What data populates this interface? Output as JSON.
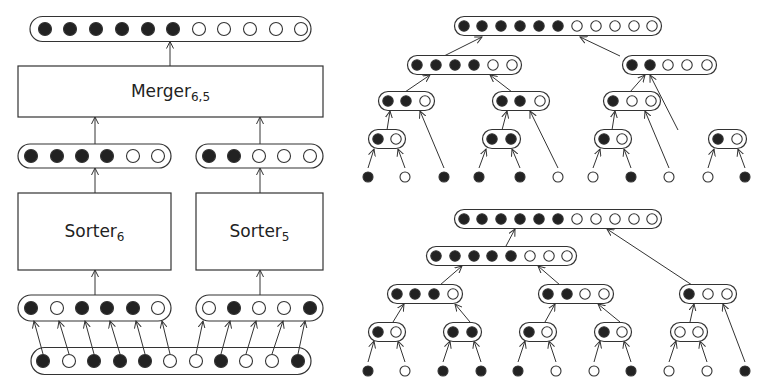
{
  "colors": {
    "stroke": "#333333",
    "filled": "#222222",
    "empty": "#ffffff",
    "background": "#ffffff"
  },
  "left_diagram": {
    "output": {
      "x1": 30,
      "x2": 311,
      "y": 29,
      "h": 25,
      "dots": [
        45,
        70,
        96,
        122,
        148,
        173,
        199,
        224,
        250,
        276,
        301
      ],
      "values": [
        1,
        1,
        1,
        1,
        1,
        1,
        0,
        0,
        0,
        0,
        0
      ]
    },
    "merger": {
      "label": "Merger",
      "subscript": "6,5",
      "x": 18,
      "y": 66,
      "w": 305,
      "h": 51
    },
    "mid_left": {
      "x1": 18,
      "x2": 171,
      "y": 156,
      "h": 24,
      "dots": [
        31,
        57,
        82,
        107,
        133,
        158
      ],
      "values": [
        1,
        1,
        1,
        1,
        0,
        0
      ]
    },
    "mid_right": {
      "x1": 196,
      "x2": 323,
      "y": 156,
      "h": 24,
      "dots": [
        209,
        234,
        259,
        284,
        310
      ],
      "values": [
        1,
        1,
        0,
        0,
        0
      ]
    },
    "sorter_left": {
      "label": "Sorter",
      "subscript": "6",
      "x": 18,
      "y": 193,
      "w": 153,
      "h": 77
    },
    "sorter_right": {
      "label": "Sorter",
      "subscript": "5",
      "x": 196,
      "y": 193,
      "w": 127,
      "h": 77
    },
    "in_left": {
      "x1": 18,
      "x2": 171,
      "y": 308,
      "h": 26,
      "dots": [
        31,
        57,
        82,
        107,
        133,
        158
      ],
      "values": [
        1,
        0,
        1,
        1,
        1,
        0
      ]
    },
    "in_right": {
      "x1": 196,
      "x2": 323,
      "y": 308,
      "h": 26,
      "dots": [
        209,
        234,
        259,
        284,
        310
      ],
      "values": [
        0,
        1,
        0,
        0,
        1
      ]
    },
    "input": {
      "x1": 31,
      "x2": 311,
      "y": 361,
      "h": 27,
      "dots": [
        43,
        69,
        94,
        120,
        145,
        170,
        196,
        221,
        246,
        272,
        298
      ],
      "values": [
        1,
        0,
        1,
        1,
        1,
        0,
        0,
        1,
        0,
        0,
        1
      ]
    },
    "split_arrows": [
      [
        43,
        34
      ],
      [
        69,
        59
      ],
      [
        94,
        85
      ],
      [
        120,
        110
      ],
      [
        145,
        136
      ],
      [
        170,
        162
      ],
      [
        196,
        203
      ],
      [
        221,
        230
      ],
      [
        246,
        256
      ],
      [
        272,
        283
      ],
      [
        298,
        305
      ]
    ]
  },
  "right_top_tree": {
    "nodes": [
      {
        "id": "root",
        "y": 26,
        "dots": [
          464,
          482,
          501,
          520,
          539,
          558,
          577,
          596,
          615,
          634,
          652
        ],
        "values": [
          1,
          1,
          1,
          1,
          1,
          1,
          0,
          0,
          0,
          0,
          0
        ]
      },
      {
        "id": "L",
        "y": 65,
        "dots": [
          417,
          436,
          455,
          474,
          493,
          512
        ],
        "values": [
          1,
          1,
          1,
          1,
          0,
          0
        ]
      },
      {
        "id": "R",
        "y": 65,
        "dots": [
          632,
          650,
          668,
          687,
          707
        ],
        "values": [
          1,
          1,
          0,
          0,
          0
        ]
      },
      {
        "id": "LL",
        "y": 101,
        "dots": [
          388,
          406,
          425
        ],
        "values": [
          1,
          1,
          0
        ]
      },
      {
        "id": "LR",
        "y": 101,
        "dots": [
          502,
          520,
          540
        ],
        "values": [
          1,
          1,
          0
        ]
      },
      {
        "id": "RL",
        "y": 101,
        "dots": [
          613,
          632,
          651
        ],
        "values": [
          1,
          0,
          0
        ]
      },
      {
        "id": "LLa",
        "y": 139,
        "dots": [
          378,
          396
        ],
        "values": [
          1,
          0
        ]
      },
      {
        "id": "LRa",
        "y": 139,
        "dots": [
          492,
          511
        ],
        "values": [
          1,
          1
        ]
      },
      {
        "id": "RLa",
        "y": 139,
        "dots": [
          604,
          622
        ],
        "values": [
          1,
          0
        ]
      },
      {
        "id": "RR",
        "y": 139,
        "dots": [
          718,
          737
        ],
        "values": [
          1,
          0
        ]
      }
    ],
    "leaves": {
      "y": 177,
      "x": [
        368,
        405,
        444,
        479,
        520,
        558,
        593,
        631,
        669,
        708,
        745
      ],
      "values": [
        1,
        0,
        1,
        1,
        1,
        0,
        0,
        1,
        0,
        0,
        1
      ]
    },
    "edges": [
      [
        444,
        56,
        482,
        37
      ],
      [
        620,
        56,
        580,
        37
      ],
      [
        405,
        92,
        430,
        75
      ],
      [
        512,
        92,
        490,
        75
      ],
      [
        630,
        92,
        645,
        75
      ],
      [
        678,
        130,
        650,
        75
      ],
      [
        387,
        130,
        390,
        111
      ],
      [
        444,
        168,
        420,
        111
      ],
      [
        502,
        130,
        507,
        111
      ],
      [
        558,
        168,
        530,
        111
      ],
      [
        612,
        130,
        615,
        111
      ],
      [
        669,
        168,
        645,
        111
      ],
      [
        368,
        168,
        374,
        149
      ],
      [
        405,
        168,
        398,
        149
      ],
      [
        479,
        168,
        486,
        149
      ],
      [
        520,
        168,
        512,
        149
      ],
      [
        593,
        168,
        600,
        149
      ],
      [
        631,
        168,
        624,
        149
      ],
      [
        708,
        168,
        714,
        149
      ],
      [
        745,
        168,
        738,
        149
      ]
    ]
  },
  "right_bottom_tree": {
    "nodes": [
      {
        "id": "root",
        "y": 219,
        "dots": [
          464,
          482,
          501,
          520,
          539,
          558,
          577,
          596,
          615,
          634,
          652
        ],
        "values": [
          1,
          1,
          1,
          1,
          1,
          1,
          0,
          0,
          0,
          0,
          0
        ]
      },
      {
        "id": "L",
        "y": 256,
        "dots": [
          436,
          455,
          474,
          492,
          511,
          530,
          549,
          567
        ],
        "values": [
          1,
          1,
          1,
          1,
          1,
          0,
          0,
          0
        ]
      },
      {
        "id": "LL",
        "y": 294,
        "dots": [
          397,
          415,
          434,
          453
        ],
        "values": [
          1,
          1,
          1,
          0
        ]
      },
      {
        "id": "LR",
        "y": 294,
        "dots": [
          548,
          567,
          585,
          604
        ],
        "values": [
          1,
          1,
          0,
          0
        ]
      },
      {
        "id": "R",
        "y": 294,
        "dots": [
          689,
          708,
          727
        ],
        "values": [
          1,
          0,
          0
        ]
      },
      {
        "id": "LLa",
        "y": 332,
        "dots": [
          378,
          396
        ],
        "values": [
          1,
          0
        ]
      },
      {
        "id": "LLb",
        "y": 332,
        "dots": [
          453,
          472
        ],
        "values": [
          1,
          1
        ]
      },
      {
        "id": "LRa",
        "y": 332,
        "dots": [
          529,
          547
        ],
        "values": [
          1,
          0
        ]
      },
      {
        "id": "LRb",
        "y": 332,
        "dots": [
          604,
          622
        ],
        "values": [
          1,
          0
        ]
      },
      {
        "id": "Ra",
        "y": 332,
        "dots": [
          680,
          698
        ],
        "values": [
          0,
          0
        ]
      }
    ],
    "leaves": {
      "y": 371,
      "x": [
        368,
        405,
        443,
        481,
        518,
        556,
        594,
        631,
        669,
        707,
        745
      ],
      "values": [
        1,
        0,
        1,
        1,
        1,
        0,
        0,
        1,
        0,
        0,
        1
      ]
    },
    "edges": [
      [
        506,
        246,
        515,
        229
      ],
      [
        692,
        285,
        607,
        229
      ],
      [
        440,
        285,
        462,
        266
      ],
      [
        560,
        285,
        538,
        266
      ],
      [
        393,
        322,
        404,
        304
      ],
      [
        470,
        322,
        455,
        304
      ],
      [
        545,
        322,
        555,
        304
      ],
      [
        620,
        322,
        598,
        304
      ],
      [
        690,
        322,
        694,
        304
      ],
      [
        745,
        362,
        723,
        304
      ],
      [
        368,
        362,
        374,
        341
      ],
      [
        405,
        362,
        398,
        341
      ],
      [
        443,
        362,
        450,
        341
      ],
      [
        481,
        362,
        474,
        341
      ],
      [
        518,
        362,
        525,
        341
      ],
      [
        556,
        362,
        549,
        341
      ],
      [
        594,
        362,
        600,
        341
      ],
      [
        631,
        362,
        624,
        341
      ],
      [
        669,
        362,
        676,
        341
      ],
      [
        707,
        362,
        700,
        341
      ]
    ]
  }
}
